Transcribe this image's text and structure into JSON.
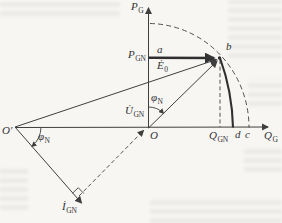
{
  "figure": {
    "type": "phasor-power-diagram",
    "background": "#f7f6f3",
    "ink": "#3f3f3f",
    "axes": {
      "vertical": {
        "main": "P",
        "sub": "G"
      },
      "horizontal": {
        "main": "Q",
        "sub": "G"
      }
    },
    "labels": {
      "p_gn": {
        "main": "P",
        "sub": "GN"
      },
      "q_gn": {
        "main": "Q",
        "sub": "GN"
      },
      "e0": {
        "main": "Ė",
        "sub": "0"
      },
      "u_gn": {
        "main": "U̇",
        "sub": "GN"
      },
      "i_gn": {
        "main": "İ",
        "sub": "GN"
      },
      "phi_at_o": {
        "main": "φ",
        "sub": "N"
      },
      "phi_at_oprime": {
        "main": "φ",
        "sub": "N"
      },
      "origin": "O",
      "origin_prime": "O′",
      "point_a": "a",
      "point_b": "b",
      "point_c": "c",
      "point_d": "d"
    }
  }
}
